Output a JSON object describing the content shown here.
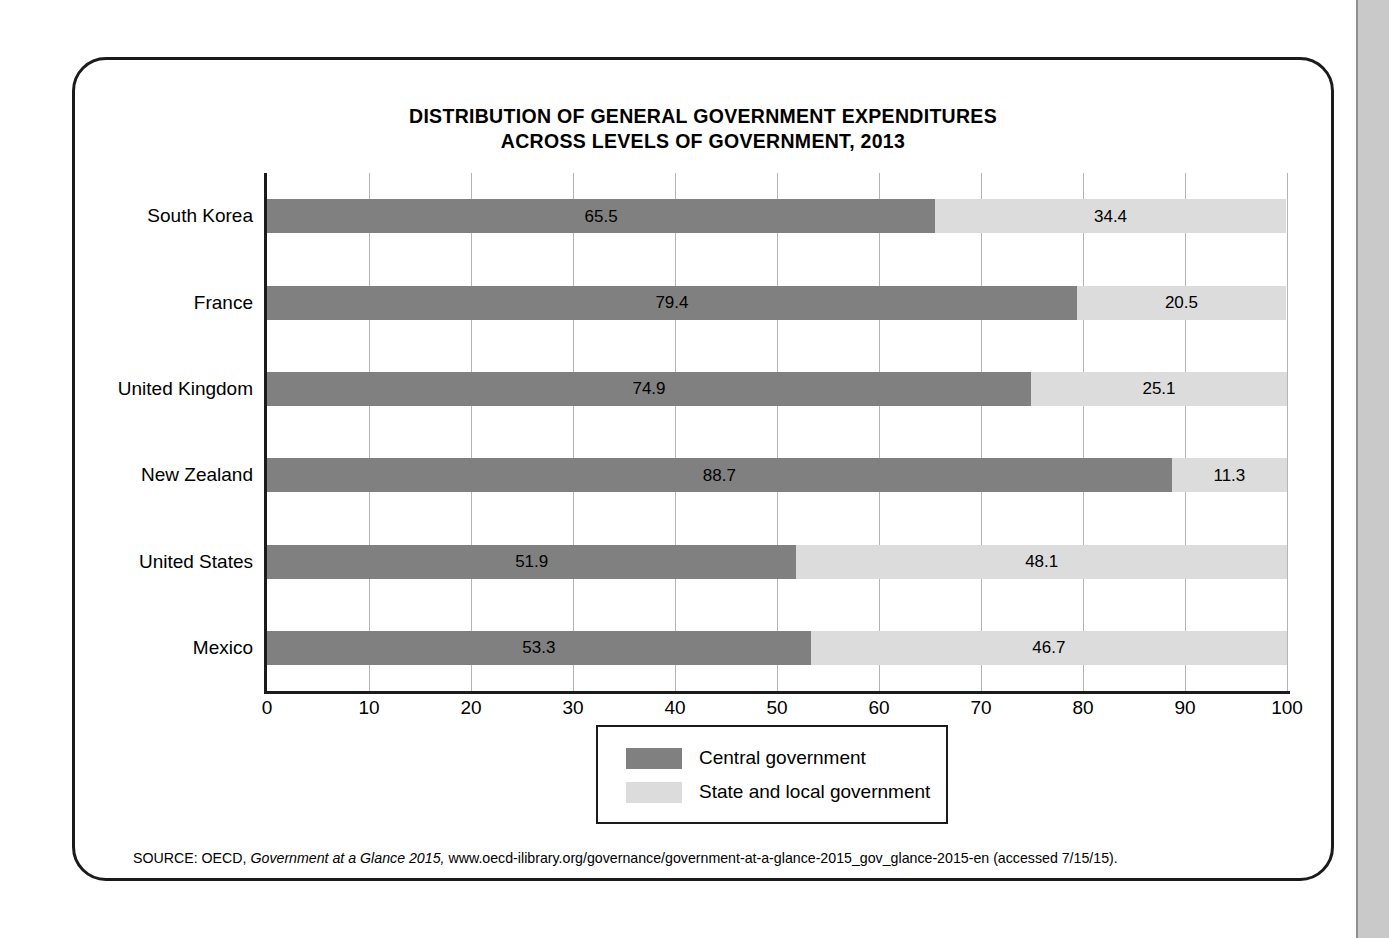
{
  "figure": {
    "title_line1": "DISTRIBUTION OF GENERAL GOVERNMENT EXPENDITURES",
    "title_line2": "ACROSS LEVELS OF GOVERNMENT, 2013",
    "source_prefix": "SOURCE: OECD,",
    "source_italic": "Government at a Glance 2015,",
    "source_rest": "www.oecd-ilibrary.org/governance/government-at-a-glance-2015_gov_glance-2015-en (accessed 7/15/15)."
  },
  "legend": {
    "central_label": "Central government",
    "local_label": "State and local government"
  },
  "colors": {
    "central": "#808080",
    "local": "#dcdcdc",
    "frame": "#1b1b1b",
    "gridline": "#b4b4b4",
    "page_edge": "#c9c9c9"
  },
  "chart_data": {
    "type": "bar",
    "orientation": "horizontal",
    "stacked": true,
    "title": "DISTRIBUTION OF GENERAL GOVERNMENT EXPENDITURES ACROSS LEVELS OF GOVERNMENT, 2013",
    "xlabel": "",
    "ylabel": "",
    "xlim": [
      0,
      100
    ],
    "xticks": [
      0,
      10,
      20,
      30,
      40,
      50,
      60,
      70,
      80,
      90,
      100
    ],
    "xtick_labels": [
      "0",
      "10",
      "20",
      "30",
      "40",
      "50",
      "60",
      "70",
      "80",
      "90",
      "100"
    ],
    "grid": "vertical",
    "legend_position": "bottom-center",
    "categories": [
      "South Korea",
      "France",
      "United Kingdom",
      "New Zealand",
      "United States",
      "Mexico"
    ],
    "series": [
      {
        "name": "Central government",
        "color": "#808080",
        "values": [
          65.5,
          79.4,
          74.9,
          88.7,
          51.9,
          53.3
        ],
        "labels": [
          "65.5",
          "79.4",
          "74.9",
          "88.7",
          "51.9",
          "53.3"
        ]
      },
      {
        "name": "State and local government",
        "color": "#dcdcdc",
        "values": [
          34.4,
          20.5,
          25.1,
          11.3,
          48.1,
          46.7
        ],
        "labels": [
          "34.4",
          "20.5",
          "25.1",
          "11.3",
          "48.1",
          "46.7"
        ]
      }
    ]
  }
}
